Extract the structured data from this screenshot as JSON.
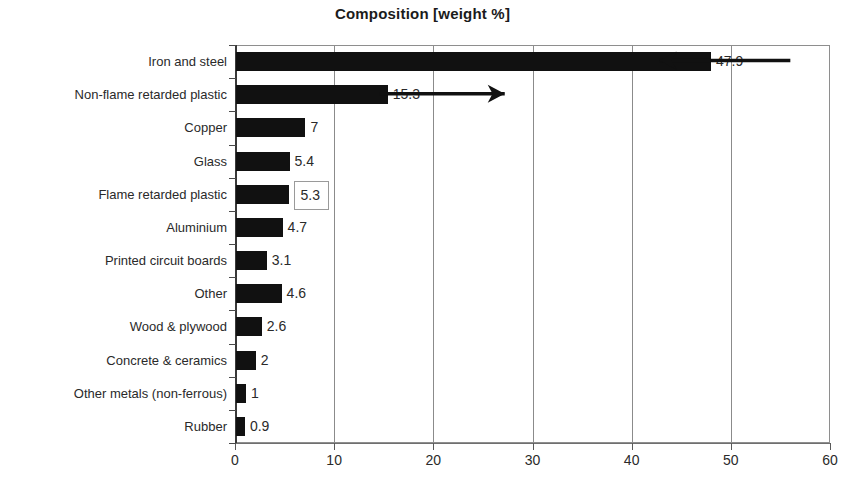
{
  "chart_data": {
    "type": "bar",
    "orientation": "horizontal",
    "title": "Composition [weight %]",
    "xlabel": "",
    "ylabel": "",
    "xlim": [
      0,
      60
    ],
    "xticks": [
      0,
      10,
      20,
      30,
      40,
      50,
      60
    ],
    "grid": true,
    "legend": null,
    "categories": [
      "Iron and steel",
      "Non-flame retarded plastic",
      "Copper",
      "Glass",
      "Flame retarded plastic",
      "Aluminium",
      "Printed circuit boards",
      "Other",
      "Wood & plywood",
      "Concrete & ceramics",
      "Other metals (non-ferrous)",
      "Rubber"
    ],
    "values": [
      47.9,
      15.3,
      7,
      5.4,
      5.3,
      4.7,
      3.1,
      4.6,
      2.6,
      2,
      1,
      0.9
    ],
    "value_labels": [
      "47.9",
      "15.3",
      "7",
      "5.4",
      "5.3",
      "4.7",
      "3.1",
      "4.6",
      "2.6",
      "2",
      "1",
      "0.9"
    ],
    "bar_color": "#111111",
    "annotations": [
      {
        "name": "arrow-iron-and-steel",
        "direction": "left",
        "row": 0,
        "from_value": 56.0,
        "to_value": 42.8
      },
      {
        "name": "arrow-non-flame-retarded-plastic",
        "direction": "right",
        "row": 1,
        "from_value": 14.6,
        "to_value": 27.2
      }
    ],
    "highlighted_label": "5.3"
  },
  "axis": {
    "tick_labels": [
      "0",
      "10",
      "20",
      "30",
      "40",
      "50",
      "60"
    ]
  }
}
